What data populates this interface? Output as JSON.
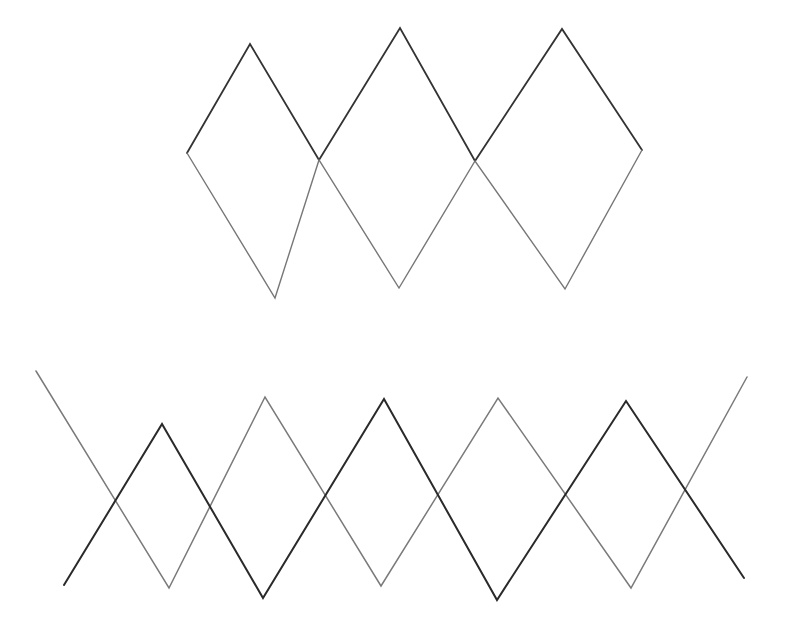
{
  "canvas": {
    "width": 790,
    "height": 642,
    "background": "#ffffff"
  },
  "figures": [
    {
      "name": "top-diamond-chain",
      "description": "Three-diamond chain formed by two zigzag polylines sharing endpoints",
      "paths": [
        {
          "name": "top-upper-zigzag",
          "color": "#333333",
          "width": 1.8,
          "points": [
            [
              187,
              153
            ],
            [
              250,
              44
            ],
            [
              319,
              160
            ],
            [
              400,
              28
            ],
            [
              475,
              161
            ],
            [
              562,
              29
            ],
            [
              642,
              150
            ]
          ]
        },
        {
          "name": "top-lower-zigzag",
          "color": "#777777",
          "width": 1.4,
          "points": [
            [
              187,
              153
            ],
            [
              275,
              298
            ],
            [
              319,
              160
            ],
            [
              399,
              288
            ],
            [
              475,
              161
            ],
            [
              565,
              289
            ],
            [
              642,
              150
            ]
          ]
        }
      ]
    },
    {
      "name": "bottom-interleaved-zigzags",
      "description": "Two interleaved zigzag polylines crossing each other",
      "paths": [
        {
          "name": "bottom-dark-zigzag",
          "color": "#2a2a2a",
          "width": 2.0,
          "points": [
            [
              64,
              585
            ],
            [
              162,
              424
            ],
            [
              263,
              598
            ],
            [
              384,
              399
            ],
            [
              497,
              600
            ],
            [
              626,
              401
            ],
            [
              744,
              578
            ]
          ]
        },
        {
          "name": "bottom-gray-zigzag",
          "color": "#7a7a7a",
          "width": 1.5,
          "points": [
            [
              36,
              371
            ],
            [
              169,
              588
            ],
            [
              265,
              397
            ],
            [
              381,
              586
            ],
            [
              498,
              398
            ],
            [
              631,
              588
            ],
            [
              747,
              377
            ]
          ]
        }
      ]
    }
  ]
}
